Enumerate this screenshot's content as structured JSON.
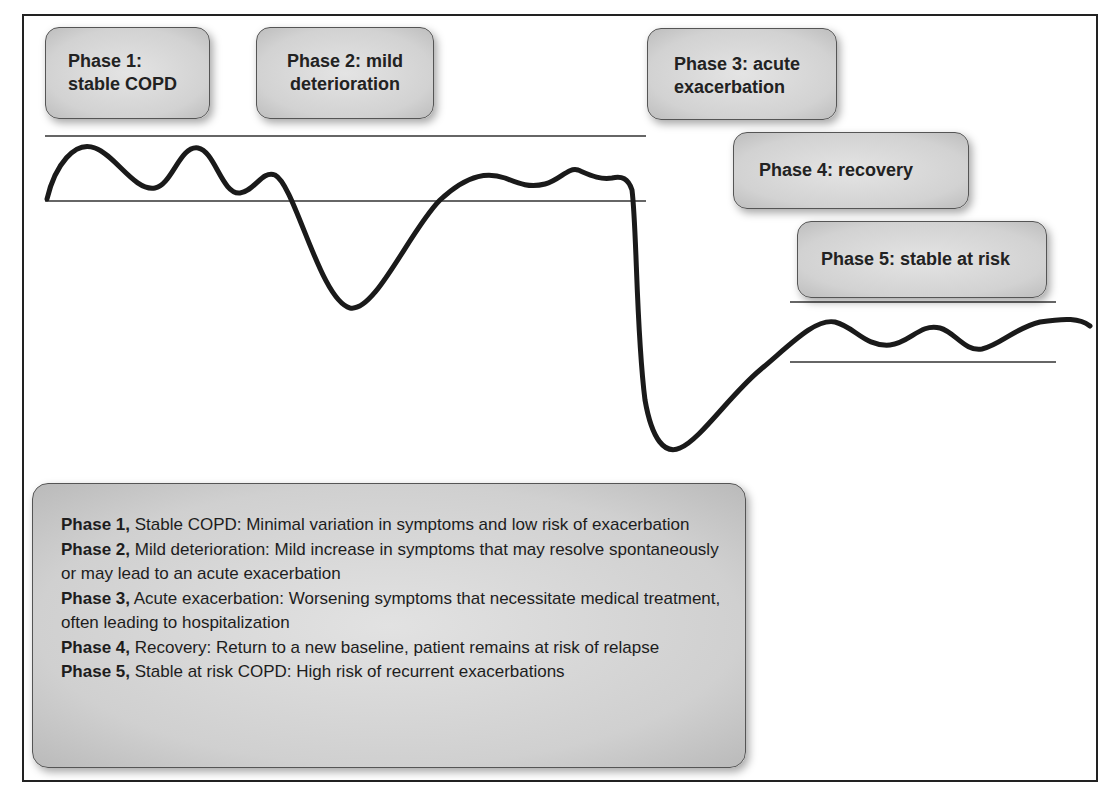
{
  "diagram": {
    "phase_labels": [
      {
        "line1": "Phase 1:",
        "line2": "stable COPD"
      },
      {
        "line1": "Phase 2: mild",
        "line2": "deterioration"
      },
      {
        "line1": "Phase 3: acute",
        "line2": "exacerbation"
      },
      {
        "line1": "Phase 4: recovery",
        "line2": ""
      },
      {
        "line1": "Phase 5: stable at risk",
        "line2": ""
      }
    ],
    "legend": [
      {
        "bold": "Phase 1,",
        "text": " Stable COPD: Minimal variation in symptoms and low risk of exacerbation"
      },
      {
        "bold": "Phase 2,",
        "text": " Mild deterioration: Mild increase in symptoms that may resolve spontaneously or may lead to an acute exacerbation"
      },
      {
        "bold": "Phase 3,",
        "text": " Acute exacerbation: Worsening symptoms that necessitate medical treatment, often leading to hospitalization"
      },
      {
        "bold": "Phase 4,",
        "text": " Recovery: Return to a new baseline, patient remains at risk of relapse"
      },
      {
        "bold": "Phase 5,",
        "text": " Stable at risk COPD: High risk of recurrent exacerbations"
      }
    ],
    "colors": {
      "line": "#1a1a1a",
      "box_fill": "#d4d4d4",
      "box_border": "#555555"
    }
  }
}
